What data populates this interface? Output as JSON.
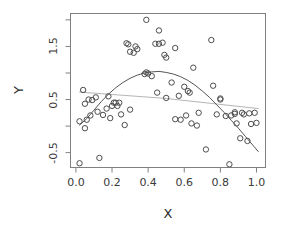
{
  "figure": {
    "background": "#ffffff",
    "frame_color": "#808080",
    "point_color": "#4d4d4d",
    "fit_curve_color": "#555555",
    "linear_fit_color": "#b5b5b5"
  },
  "axis_titles": {
    "x": "X",
    "y": "Y"
  },
  "chart_data": {
    "type": "scatter",
    "title": "",
    "xlabel": "X",
    "ylabel": "Y",
    "xlim": [
      -0.03,
      1.05
    ],
    "ylim": [
      -0.78,
      2.12
    ],
    "grid": false,
    "legend": "none",
    "xticks": [
      0.0,
      0.2,
      0.4,
      0.6,
      0.8,
      1.0
    ],
    "xtick_labels": [
      "0.0",
      "0.2",
      "0.4",
      "0.6",
      "0.8",
      "1.0"
    ],
    "yticks": [
      -0.5,
      0.5,
      1.5
    ],
    "ytick_labels": [
      "-0.5",
      "0.5",
      "1.5"
    ],
    "yticks_minor": [
      -1.0,
      0.0,
      1.0,
      2.0
    ],
    "points": [
      [
        0.02,
        -0.7
      ],
      [
        0.02,
        0.09
      ],
      [
        0.04,
        0.68
      ],
      [
        0.05,
        -0.04
      ],
      [
        0.05,
        0.42
      ],
      [
        0.06,
        0.12
      ],
      [
        0.07,
        0.5
      ],
      [
        0.08,
        0.2
      ],
      [
        0.09,
        0.49
      ],
      [
        0.11,
        0.54
      ],
      [
        0.12,
        0.27
      ],
      [
        0.13,
        -0.6
      ],
      [
        0.15,
        0.21
      ],
      [
        0.17,
        0.33
      ],
      [
        0.18,
        0.56
      ],
      [
        0.19,
        0.15
      ],
      [
        0.2,
        0.38
      ],
      [
        0.21,
        0.44
      ],
      [
        0.22,
        0.44
      ],
      [
        0.23,
        0.38
      ],
      [
        0.24,
        0.44
      ],
      [
        0.25,
        0.22
      ],
      [
        0.27,
        0.02
      ],
      [
        0.28,
        1.56
      ],
      [
        0.29,
        1.54
      ],
      [
        0.3,
        1.4
      ],
      [
        0.3,
        0.31
      ],
      [
        0.32,
        1.38
      ],
      [
        0.33,
        1.5
      ],
      [
        0.34,
        1.45
      ],
      [
        0.38,
        0.98
      ],
      [
        0.39,
        1.01
      ],
      [
        0.39,
        2.0
      ],
      [
        0.4,
        0.99
      ],
      [
        0.42,
        0.94
      ],
      [
        0.44,
        1.55
      ],
      [
        0.45,
        0.63
      ],
      [
        0.46,
        1.55
      ],
      [
        0.46,
        1.8
      ],
      [
        0.48,
        1.57
      ],
      [
        0.49,
        1.34
      ],
      [
        0.5,
        1.29
      ],
      [
        0.5,
        0.53
      ],
      [
        0.53,
        0.82
      ],
      [
        0.55,
        1.47
      ],
      [
        0.55,
        0.13
      ],
      [
        0.57,
        0.57
      ],
      [
        0.58,
        0.12
      ],
      [
        0.6,
        0.74
      ],
      [
        0.61,
        0.2
      ],
      [
        0.62,
        0.66
      ],
      [
        0.63,
        0.63
      ],
      [
        0.64,
        0.05
      ],
      [
        0.65,
        1.1
      ],
      [
        0.67,
        0.01
      ],
      [
        0.68,
        0.25
      ],
      [
        0.72,
        -0.44
      ],
      [
        0.75,
        1.62
      ],
      [
        0.76,
        0.76
      ],
      [
        0.78,
        0.22
      ],
      [
        0.8,
        0.52
      ],
      [
        0.8,
        0.5
      ],
      [
        0.83,
        0.19
      ],
      [
        0.85,
        -0.72
      ],
      [
        0.86,
        0.2
      ],
      [
        0.88,
        0.23
      ],
      [
        0.88,
        0.26
      ],
      [
        0.89,
        0.05
      ],
      [
        0.91,
        -0.23
      ],
      [
        0.92,
        0.25
      ],
      [
        0.93,
        0.22
      ],
      [
        0.95,
        -0.28
      ],
      [
        0.96,
        0.24
      ],
      [
        0.97,
        0.04
      ],
      [
        0.99,
        0.25
      ],
      [
        1.0,
        0.06
      ]
    ],
    "fit_curve": {
      "name": "smooth-fit",
      "color": "#555555",
      "points": [
        [
          0.02,
          0.02
        ],
        [
          0.06,
          0.14
        ],
        [
          0.1,
          0.3
        ],
        [
          0.14,
          0.46
        ],
        [
          0.18,
          0.6
        ],
        [
          0.22,
          0.72
        ],
        [
          0.26,
          0.82
        ],
        [
          0.3,
          0.9
        ],
        [
          0.34,
          0.96
        ],
        [
          0.38,
          1.0
        ],
        [
          0.42,
          1.02
        ],
        [
          0.46,
          1.03
        ],
        [
          0.5,
          1.01
        ],
        [
          0.54,
          0.98
        ],
        [
          0.58,
          0.93
        ],
        [
          0.62,
          0.86
        ],
        [
          0.66,
          0.77
        ],
        [
          0.7,
          0.66
        ],
        [
          0.74,
          0.54
        ],
        [
          0.78,
          0.4
        ],
        [
          0.82,
          0.26
        ],
        [
          0.86,
          0.11
        ],
        [
          0.9,
          -0.04
        ],
        [
          0.94,
          -0.2
        ],
        [
          0.98,
          -0.36
        ],
        [
          1.01,
          -0.48
        ]
      ]
    },
    "linear_fit": {
      "name": "linear-fit",
      "color": "#b5b5b5",
      "points": [
        [
          0.02,
          0.64
        ],
        [
          0.5,
          0.52
        ],
        [
          1.01,
          0.33
        ]
      ]
    }
  }
}
